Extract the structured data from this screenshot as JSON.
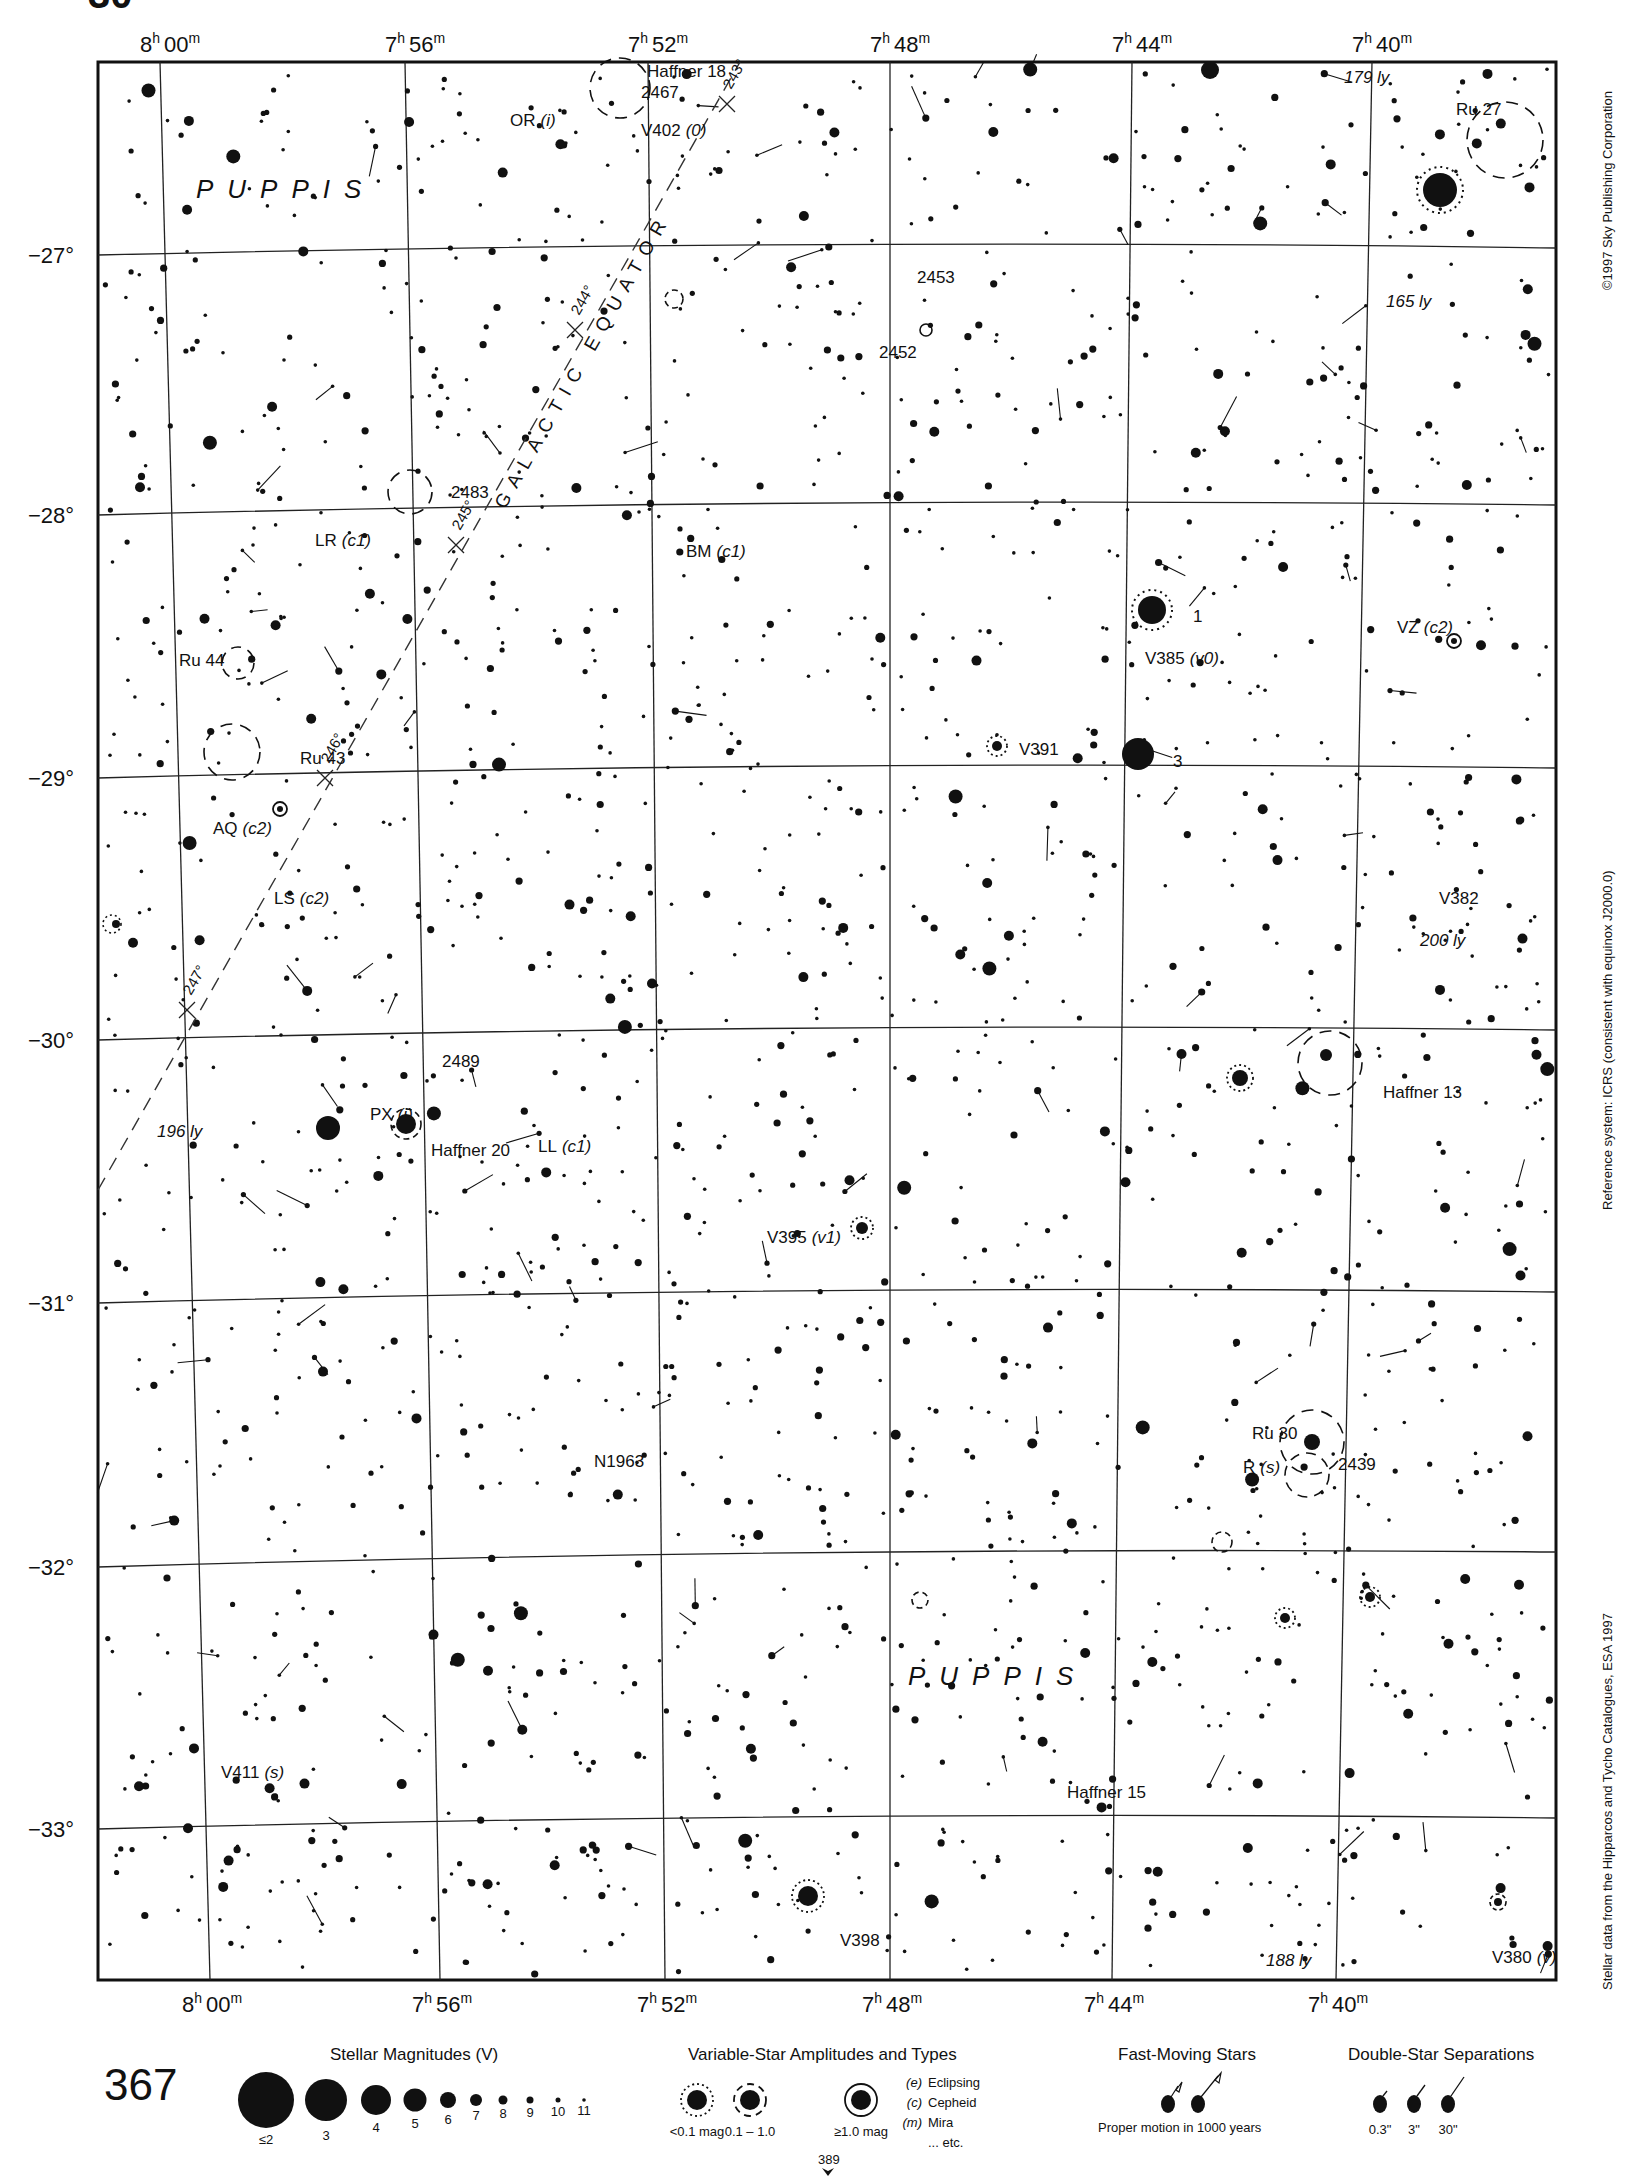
{
  "page": {
    "header_fragment": "30",
    "plate_number": "367",
    "continuation_page": "389"
  },
  "chart_data": {
    "type": "star-atlas-chart",
    "constellation": "PUPPIS",
    "ra_ticks": [
      {
        "h": "8",
        "m": "00"
      },
      {
        "h": "7",
        "m": "56"
      },
      {
        "h": "7",
        "m": "52"
      },
      {
        "h": "7",
        "m": "48"
      },
      {
        "h": "7",
        "m": "44"
      },
      {
        "h": "7",
        "m": "40"
      }
    ],
    "dec_ticks": [
      "−27°",
      "−28°",
      "−29°",
      "−30°",
      "−31°",
      "−32°",
      "−33°"
    ],
    "galactic_equator": {
      "label": "GALACTIC   EQUATOR",
      "longitude_marks": [
        "243°",
        "244°",
        "245°",
        "246°",
        "247°"
      ]
    },
    "objects": [
      {
        "name": "Haffner 18",
        "x": 462,
        "y": 55,
        "type": "cluster"
      },
      {
        "name": "2467",
        "x": 458,
        "y": 70,
        "type": "nebula"
      },
      {
        "name": "V402",
        "suffix": "(0)",
        "x": 458,
        "y": 97,
        "type": "variable"
      },
      {
        "name": "OR",
        "suffix": "(i)",
        "x": 364,
        "y": 90,
        "type": "variable"
      },
      {
        "name": "Ru 27",
        "x": 1040,
        "y": 82,
        "type": "cluster"
      },
      {
        "name": "179 ly",
        "x": 960,
        "y": 59,
        "type": "distance"
      },
      {
        "name": "165 ly",
        "x": 990,
        "y": 219,
        "type": "distance"
      },
      {
        "name": "2453",
        "x": 655,
        "y": 202,
        "type": "cluster"
      },
      {
        "name": "2452",
        "x": 628,
        "y": 256,
        "type": "planetary-nebula"
      },
      {
        "name": "2483",
        "x": 322,
        "y": 356,
        "type": "cluster"
      },
      {
        "name": "LR",
        "suffix": "(c1)",
        "x": 225,
        "y": 390,
        "type": "variable"
      },
      {
        "name": "BM",
        "suffix": "(c1)",
        "x": 490,
        "y": 398,
        "type": "variable"
      },
      {
        "name": "1",
        "x": 852,
        "y": 444,
        "type": "star-number"
      },
      {
        "name": "V385",
        "suffix": "(v0)",
        "x": 818,
        "y": 474,
        "type": "variable"
      },
      {
        "name": "VZ",
        "suffix": "(c2)",
        "x": 998,
        "y": 452,
        "type": "variable"
      },
      {
        "name": "Ru 44",
        "x": 128,
        "y": 476,
        "type": "cluster"
      },
      {
        "name": "V391",
        "x": 728,
        "y": 539,
        "type": "variable"
      },
      {
        "name": "3",
        "x": 838,
        "y": 548,
        "type": "star-number"
      },
      {
        "name": "Ru 43",
        "x": 214,
        "y": 546,
        "type": "cluster"
      },
      {
        "name": "AQ",
        "suffix": "(c2)",
        "x": 152,
        "y": 596,
        "type": "variable"
      },
      {
        "name": "LS",
        "suffix": "(c2)",
        "x": 196,
        "y": 646,
        "type": "variable"
      },
      {
        "name": "V382",
        "x": 1028,
        "y": 646,
        "type": "variable"
      },
      {
        "name": "200 ly",
        "x": 1014,
        "y": 676,
        "type": "distance"
      },
      {
        "name": "2489",
        "x": 316,
        "y": 762,
        "type": "cluster"
      },
      {
        "name": "Haffner 13",
        "x": 988,
        "y": 784,
        "type": "cluster"
      },
      {
        "name": "PX",
        "suffix": "(i)",
        "x": 264,
        "y": 800,
        "type": "variable"
      },
      {
        "name": "196 ly",
        "x": 112,
        "y": 812,
        "type": "distance"
      },
      {
        "name": "Haffner 20",
        "x": 308,
        "y": 826,
        "type": "cluster"
      },
      {
        "name": "LL",
        "suffix": "(c1)",
        "x": 384,
        "y": 823,
        "type": "variable"
      },
      {
        "name": "V395",
        "suffix": "(v1)",
        "x": 548,
        "y": 888,
        "type": "variable"
      },
      {
        "name": "N1963",
        "x": 424,
        "y": 1048,
        "type": "galaxy"
      },
      {
        "name": "Ru 30",
        "x": 894,
        "y": 1028,
        "type": "cluster"
      },
      {
        "name": "R",
        "suffix": "(s)",
        "x": 888,
        "y": 1052,
        "type": "variable"
      },
      {
        "name": "2439",
        "x": 956,
        "y": 1050,
        "type": "cluster"
      },
      {
        "name": "V411",
        "suffix": "(s)",
        "x": 158,
        "y": 1270,
        "type": "variable"
      },
      {
        "name": "Haffner 15",
        "x": 762,
        "y": 1284,
        "type": "cluster"
      },
      {
        "name": "V398",
        "x": 600,
        "y": 1390,
        "type": "variable"
      },
      {
        "name": "188 ly",
        "x": 904,
        "y": 1404,
        "type": "distance"
      },
      {
        "name": "V380",
        "suffix": "(v)",
        "x": 1066,
        "y": 1402,
        "type": "variable"
      }
    ]
  },
  "side_notes": {
    "copyright": "©1997 Sky Publishing Corporation",
    "reference": "Reference system: ICRS (consistent with equinox J2000.0)",
    "data_source": "Stellar data from the Hipparcos and Tycho Catalogues, ESA 1997"
  },
  "legend": {
    "magnitudes": {
      "title": "Stellar Magnitudes (V)",
      "labels": [
        "≤2",
        "3",
        "4",
        "5",
        "6",
        "7",
        "8",
        "9",
        "10",
        "11"
      ]
    },
    "variables": {
      "title": "Variable-Star Amplitudes and Types",
      "amplitudes": [
        "<0.1 mag",
        "0.1 – 1.0",
        "≥1.0 mag"
      ],
      "types": [
        {
          "code": "(e)",
          "name": "Eclipsing"
        },
        {
          "code": "(c)",
          "name": "Cepheid"
        },
        {
          "code": "(m)",
          "name": "Mira"
        },
        {
          "code": "",
          "name": "... etc."
        }
      ]
    },
    "fast_moving": {
      "title": "Fast-Moving Stars",
      "caption": "Proper motion in 1000 years"
    },
    "doubles": {
      "title": "Double-Star Separations",
      "labels": [
        "0.3\"",
        "3\"",
        "30\""
      ]
    }
  }
}
